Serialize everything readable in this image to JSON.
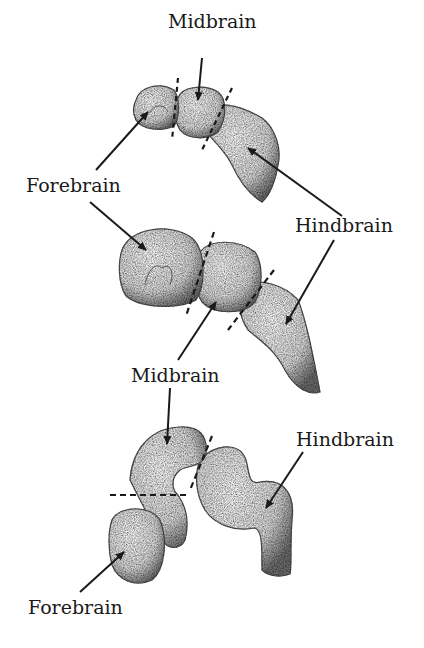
{
  "diagram": {
    "title": "",
    "stages": [
      {
        "id": "stage-1",
        "labels": {
          "midbrain": "Midbrain",
          "forebrain": "Forebrain",
          "hindbrain": "Hindbrain"
        }
      },
      {
        "id": "stage-2",
        "labels": {
          "forebrain": "Forebrain",
          "hindbrain": "Hindbrain",
          "midbrain": "Midbrain"
        }
      },
      {
        "id": "stage-3",
        "labels": {
          "midbrain": "Midbrain",
          "hindbrain": "Hindbrain",
          "forebrain": "Forebrain"
        }
      }
    ],
    "text_labels": [
      {
        "text": "Midbrain",
        "x": 168,
        "y": 12
      },
      {
        "text": "Forebrain",
        "x": 26,
        "y": 176
      },
      {
        "text": "Hindbrain",
        "x": 295,
        "y": 216
      },
      {
        "text": "Midbrain",
        "x": 131,
        "y": 366
      },
      {
        "text": "Hindbrain",
        "x": 296,
        "y": 430
      },
      {
        "text": "Forebrain",
        "x": 28,
        "y": 598
      }
    ],
    "colors": {
      "ink": "#1a1a1a",
      "shade": "#8a8a8a",
      "fill": "#efefef",
      "background": "#ffffff"
    }
  }
}
